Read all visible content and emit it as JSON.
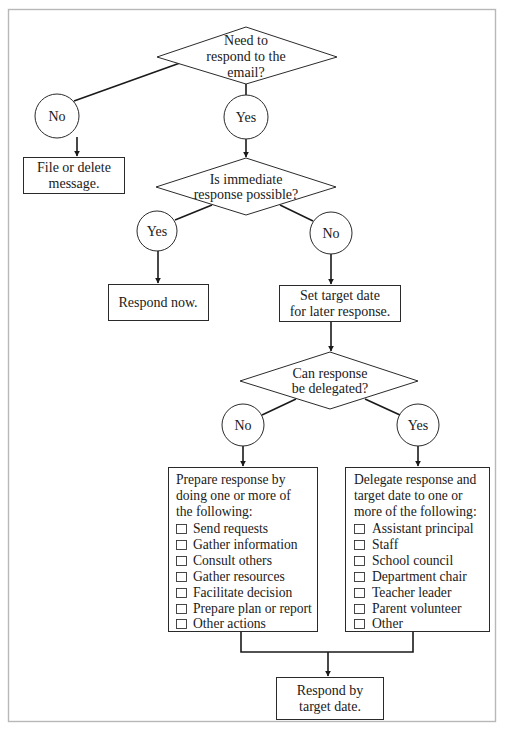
{
  "figure": {
    "frame_color": "#b8b8b8",
    "line_color": "#1a1a1a"
  },
  "decisions": {
    "respond_needed": {
      "lines": [
        "Need to",
        "respond to the",
        "email?"
      ]
    },
    "immediate": {
      "lines": [
        "Is immediate",
        "response possible?"
      ]
    },
    "delegate": {
      "lines": [
        "Can response",
        "be delegated?"
      ]
    }
  },
  "answers": {
    "respond_needed_no": "No",
    "respond_needed_yes": "Yes",
    "immediate_yes": "Yes",
    "immediate_no": "No",
    "delegate_no": "No",
    "delegate_yes": "Yes"
  },
  "actions": {
    "file_delete": {
      "lines": [
        "File or delete",
        "message."
      ]
    },
    "respond_now": {
      "lines": [
        "Respond now."
      ]
    },
    "set_target": {
      "lines": [
        "Set target date",
        "for later response."
      ]
    },
    "respond_by": {
      "lines": [
        "Respond by",
        "target date."
      ]
    }
  },
  "prepare_box": {
    "intro": [
      "Prepare response by",
      "doing one or more of",
      "the following:"
    ],
    "items": [
      "Send requests",
      "Gather information",
      "Consult others",
      "Gather resources",
      "Facilitate decision",
      "Prepare plan or report",
      "Other actions"
    ]
  },
  "delegate_box": {
    "intro": [
      "Delegate response and",
      "target date to one or",
      "more of the following:"
    ],
    "items": [
      "Assistant principal",
      "Staff",
      "School council",
      "Department chair",
      "Teacher leader",
      "Parent volunteer",
      "Other"
    ]
  }
}
